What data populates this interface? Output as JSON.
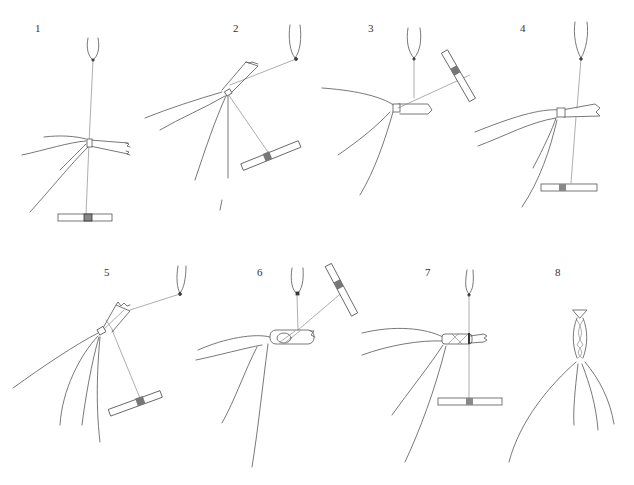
{
  "figure": {
    "panels": [
      {
        "number": "1",
        "label": "1"
      },
      {
        "number": "2",
        "label": "2"
      },
      {
        "number": "3",
        "label": "3"
      },
      {
        "number": "4",
        "label": "4"
      },
      {
        "number": "5",
        "label": "5"
      },
      {
        "number": "6",
        "label": "6"
      },
      {
        "number": "7",
        "label": "7"
      },
      {
        "number": "8",
        "label": "8"
      }
    ],
    "colors": {
      "background": "#ffffff",
      "ink": "#555555"
    }
  }
}
